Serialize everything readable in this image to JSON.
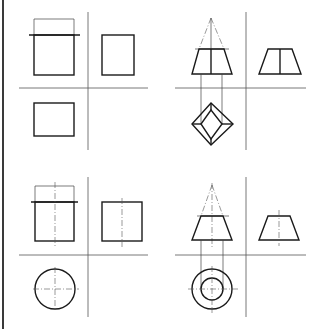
{
  "figure": {
    "colors": {
      "line": "#1a1a1a",
      "construction": "#555555",
      "background": "#ffffff"
    },
    "panels": [
      {
        "id": "prism",
        "label": "Square prism (truncated)",
        "views": [
          "front",
          "side",
          "top"
        ]
      },
      {
        "id": "pyramid",
        "label": "Square pyramid frustum",
        "views": [
          "front",
          "side",
          "top"
        ]
      },
      {
        "id": "cylinder",
        "label": "Cylinder (truncated)",
        "views": [
          "front",
          "side",
          "top"
        ]
      },
      {
        "id": "cone",
        "label": "Cone frustum",
        "views": [
          "front",
          "side",
          "top"
        ]
      }
    ]
  }
}
